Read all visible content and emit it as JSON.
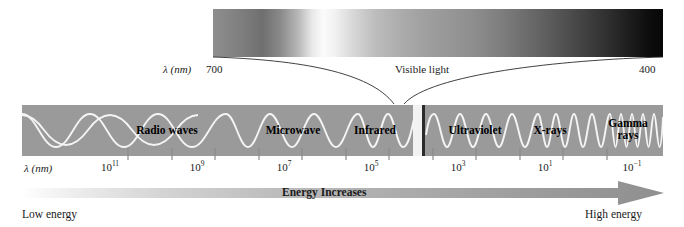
{
  "figure": {
    "type": "electromagnetic-spectrum-diagram"
  },
  "visible_light": {
    "lambda_label": "λ (nm)",
    "left_wavelength": "700",
    "caption": "Visible light",
    "right_wavelength": "400",
    "gradient_note": "grayscale rendering of red-to-violet visible spectrum"
  },
  "spectrum": {
    "lambda_label": "λ (nm)",
    "bands": [
      {
        "name": "Radio waves",
        "label": "Radio waves",
        "center_pct": 23.0
      },
      {
        "name": "Microwave",
        "label": "Microwave",
        "center_pct": 46.5
      },
      {
        "name": "Infrared",
        "label": "Infrared",
        "center_pct": 57.5
      },
      {
        "name": "Ultraviolet",
        "label": "Ultraviolet",
        "center_pct": 70.0
      },
      {
        "name": "X-rays",
        "label": "X-rays",
        "center_pct": 82.0
      },
      {
        "name": "Gamma rays",
        "label_line1": "Gamma",
        "label_line2": "rays",
        "center_pct": 94.5
      }
    ],
    "ticks": [
      {
        "label_base": "10",
        "exponent": "11",
        "x_pct": 16.5
      },
      {
        "label_base": "10",
        "exponent": "9",
        "x_pct": 30.0
      },
      {
        "label_base": "10",
        "exponent": "7",
        "x_pct": 43.5
      },
      {
        "label_base": "10",
        "exponent": "5",
        "x_pct": 57.0
      },
      {
        "label_base": "10",
        "exponent": "3",
        "x_pct": 70.5
      },
      {
        "label_base": "10",
        "exponent": "1",
        "x_pct": 84.0
      },
      {
        "label_base": "10",
        "exponent": "−1",
        "x_pct": 97.5
      },
      {
        "label_base": "10",
        "exponent": "−3",
        "x_pct": 111.0
      }
    ]
  },
  "energy_axis": {
    "arrow_label": "Energy Increases",
    "left_caption": "Low energy",
    "right_caption": "High energy",
    "direction": "left-to-right"
  },
  "colors": {
    "bar_gray": "#9a9a9a",
    "wave_white": "#f4f4f4",
    "slit_light": "#f2f2f2",
    "slit_dark": "#2b2b2b",
    "text": "#1a1a1a",
    "background": "#ffffff"
  }
}
